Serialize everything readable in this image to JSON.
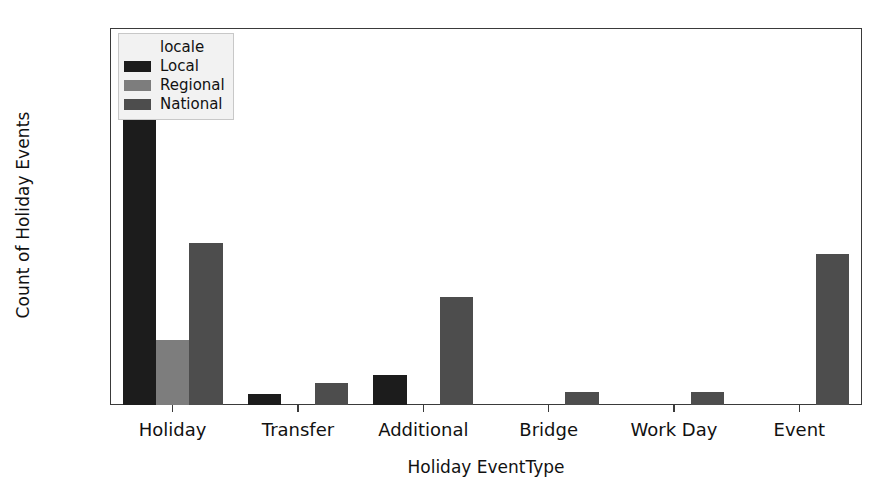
{
  "chart_data": {
    "type": "bar",
    "title": "",
    "xlabel": "Holiday EventType",
    "ylabel": "Count of Holiday Events",
    "categories": [
      "Holiday",
      "Transfer",
      "Additional",
      "Bridge",
      "Work Day",
      "Event"
    ],
    "legend_title": "locale",
    "legend_position": "upper left",
    "grid": false,
    "ylim": [
      0,
      140
    ],
    "yticks": [
      0,
      20,
      40,
      60,
      80,
      100,
      120,
      140
    ],
    "series": [
      {
        "name": "Local",
        "color": "#1c1c1c",
        "values": [
          110,
          4,
          11,
          0,
          0,
          0
        ]
      },
      {
        "name": "Regional",
        "color": "#7d7d7d",
        "values": [
          24,
          0,
          0,
          0,
          0,
          0
        ]
      },
      {
        "name": "National",
        "color": "#4d4d4d",
        "values": [
          60,
          8,
          40,
          5,
          5,
          56
        ]
      }
    ]
  },
  "legend": {
    "title": "locale",
    "entries": [
      {
        "label": "Local",
        "color": "#1c1c1c"
      },
      {
        "label": "Regional",
        "color": "#7d7d7d"
      },
      {
        "label": "National",
        "color": "#4d4d4d"
      }
    ]
  },
  "axes": {
    "ylabel": "Count of Holiday Events",
    "xlabel": "Holiday EventType",
    "ytick_labels": [
      "0",
      "20",
      "40",
      "60",
      "80",
      "100",
      "120",
      "140"
    ],
    "xtick_labels": [
      "Holiday",
      "Transfer",
      "Additional",
      "Bridge",
      "Work Day",
      "Event"
    ]
  },
  "style": {
    "axis_color": "#3a3a3a",
    "background": "#ffffff",
    "legend_background": "#f2f2f2",
    "legend_border": "#c8c8c8"
  }
}
